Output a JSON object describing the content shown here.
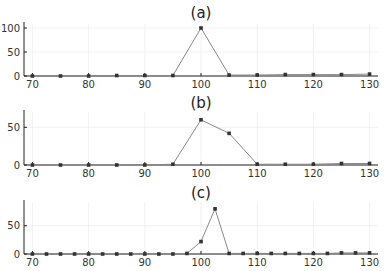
{
  "chart_data": [
    {
      "type": "line",
      "title": "(a)",
      "xlabel": "",
      "ylabel": "",
      "xlim": [
        68.5,
        131.5
      ],
      "ylim": [
        0,
        100
      ],
      "xticks": [
        70,
        80,
        90,
        100,
        110,
        120,
        130
      ],
      "yticks": [
        0,
        50,
        100
      ],
      "grid": true,
      "legend": null,
      "series": [
        {
          "name": "a",
          "x": [
            70,
            75,
            80,
            85,
            90,
            95,
            100,
            105,
            110,
            115,
            120,
            125,
            130
          ],
          "y": [
            0,
            0,
            0,
            1,
            1,
            1,
            100,
            2,
            2,
            3,
            3,
            3,
            4
          ]
        }
      ]
    },
    {
      "type": "line",
      "title": "(b)",
      "xlabel": "",
      "ylabel": "",
      "xlim": [
        68.5,
        131.5
      ],
      "ylim": [
        0,
        65
      ],
      "xticks": [
        70,
        80,
        90,
        100,
        110,
        120,
        130
      ],
      "yticks": [
        0,
        50
      ],
      "grid": true,
      "legend": null,
      "series": [
        {
          "name": "b",
          "x": [
            70,
            75,
            80,
            85,
            90,
            95,
            100,
            105,
            110,
            115,
            120,
            125,
            130
          ],
          "y": [
            0,
            0,
            0,
            0,
            0,
            1,
            60,
            42,
            1,
            1,
            1,
            2,
            2
          ]
        }
      ]
    },
    {
      "type": "line",
      "title": "(c)",
      "xlabel": "",
      "ylabel": "",
      "xlim": [
        68.5,
        131.5
      ],
      "ylim": [
        0,
        85
      ],
      "xticks": [
        70,
        80,
        90,
        100,
        110,
        120,
        130
      ],
      "yticks": [
        0,
        50
      ],
      "grid": true,
      "legend": null,
      "series": [
        {
          "name": "c",
          "x": [
            70,
            72.5,
            75,
            77.5,
            80,
            82.5,
            85,
            87.5,
            90,
            92.5,
            95,
            97.5,
            100,
            102.5,
            105,
            107.5,
            110,
            112.5,
            115,
            117.5,
            120,
            122.5,
            125,
            127.5,
            130
          ],
          "y": [
            0,
            0,
            0,
            0,
            0,
            0,
            0,
            0,
            0,
            0,
            0,
            1,
            22,
            80,
            1,
            1,
            1,
            1,
            1,
            1,
            1,
            1,
            2,
            2,
            2
          ]
        }
      ]
    }
  ],
  "panels": [
    {
      "title": "(a)",
      "plot": {
        "top": 28,
        "bottom": 76
      },
      "title_y": 18
    },
    {
      "title": "(b)",
      "plot": {
        "top": 116,
        "bottom": 165
      },
      "title_y": 108
    },
    {
      "title": "(c)",
      "plot": {
        "top": 206,
        "bottom": 254
      },
      "title_y": 198
    }
  ]
}
